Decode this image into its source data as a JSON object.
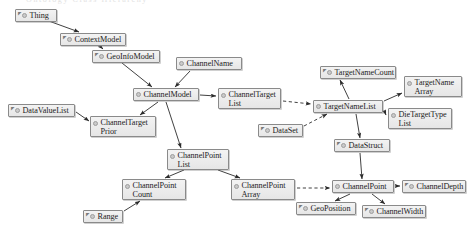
{
  "diagram": {
    "title_fragment": "Ontology Class Hierarchy",
    "canvas": {
      "width": 476,
      "height": 235
    },
    "colors": {
      "node_fill_top": "#f3f3f3",
      "node_fill_bottom": "#e6e6e6",
      "node_border": "#8a8a8a",
      "bullet_fill": "#c9c9c9",
      "edge": "#2b2b2b",
      "background": "#ffffff"
    },
    "nodes": [
      {
        "id": "thing",
        "label": "Thing",
        "x": 15,
        "y": 9,
        "w": 42,
        "h": 13,
        "sup": true,
        "lines": 1
      },
      {
        "id": "context-model",
        "label": "ContextModel",
        "x": 60,
        "y": 33,
        "w": 66,
        "h": 13,
        "sup": true,
        "lines": 1
      },
      {
        "id": "geo-info-model",
        "label": "GeoInfoModel",
        "x": 92,
        "y": 50,
        "w": 68,
        "h": 13,
        "sup": true,
        "lines": 1
      },
      {
        "id": "channel-name",
        "label": "ChannelName",
        "x": 176,
        "y": 57,
        "w": 66,
        "h": 13,
        "sup": false,
        "lines": 1
      },
      {
        "id": "channel-model",
        "label": "ChannelModel",
        "x": 133,
        "y": 88,
        "w": 66,
        "h": 13,
        "sup": false,
        "lines": 1
      },
      {
        "id": "data-value-list",
        "label": "DataValueList",
        "x": 8,
        "y": 104,
        "w": 67,
        "h": 13,
        "sup": true,
        "lines": 1
      },
      {
        "id": "channel-target-prior",
        "label": "ChannelTarget\nPrior",
        "x": 90,
        "y": 116,
        "w": 66,
        "h": 21,
        "sup": false,
        "lines": 2
      },
      {
        "id": "channel-target-list",
        "label": "ChannelTarget\nList",
        "x": 218,
        "y": 88,
        "w": 63,
        "h": 21,
        "sup": false,
        "lines": 2
      },
      {
        "id": "target-name-count",
        "label": "TargetNameCount",
        "x": 320,
        "y": 66,
        "w": 76,
        "h": 13,
        "sup": true,
        "lines": 1
      },
      {
        "id": "target-name-array",
        "label": "TargetName\nArray",
        "x": 404,
        "y": 76,
        "w": 58,
        "h": 21,
        "sup": false,
        "lines": 2
      },
      {
        "id": "target-name-list",
        "label": "TargetNameList",
        "x": 313,
        "y": 100,
        "w": 70,
        "h": 13,
        "sup": false,
        "lines": 1
      },
      {
        "id": "die-target-type-list",
        "label": "DieTargetType\nList",
        "x": 388,
        "y": 108,
        "w": 64,
        "h": 21,
        "sup": false,
        "lines": 2
      },
      {
        "id": "data-set",
        "label": "DataSet",
        "x": 258,
        "y": 124,
        "w": 45,
        "h": 13,
        "sup": true,
        "lines": 1
      },
      {
        "id": "data-struct",
        "label": "DataStruct",
        "x": 334,
        "y": 139,
        "w": 56,
        "h": 13,
        "sup": true,
        "lines": 1
      },
      {
        "id": "channel-point-list",
        "label": "ChannelPoint\nList",
        "x": 167,
        "y": 149,
        "w": 62,
        "h": 21,
        "sup": false,
        "lines": 2
      },
      {
        "id": "channel-point-count",
        "label": "ChannelPoint\nCount",
        "x": 122,
        "y": 179,
        "w": 64,
        "h": 21,
        "sup": false,
        "lines": 2
      },
      {
        "id": "channel-point-array",
        "label": "ChannelPoint\nArray",
        "x": 231,
        "y": 179,
        "w": 64,
        "h": 21,
        "sup": false,
        "lines": 2
      },
      {
        "id": "channel-point",
        "label": "ChannelPoint",
        "x": 332,
        "y": 180,
        "w": 62,
        "h": 13,
        "sup": false,
        "lines": 1
      },
      {
        "id": "channel-depth",
        "label": "ChannelDepth",
        "x": 402,
        "y": 180,
        "w": 64,
        "h": 13,
        "sup": true,
        "lines": 1
      },
      {
        "id": "range",
        "label": "Range",
        "x": 83,
        "y": 210,
        "w": 40,
        "h": 13,
        "sup": true,
        "lines": 1
      },
      {
        "id": "geo-position",
        "label": "GeoPosition",
        "x": 296,
        "y": 202,
        "w": 60,
        "h": 13,
        "sup": true,
        "lines": 1
      },
      {
        "id": "channel-width",
        "label": "ChannelWidth",
        "x": 362,
        "y": 205,
        "w": 64,
        "h": 13,
        "sup": true,
        "lines": 1
      }
    ],
    "edges": [
      {
        "from": "thing",
        "to": "context-model",
        "style": "solid",
        "x1": 46,
        "y1": 20,
        "x2": 79,
        "y2": 32
      },
      {
        "from": "context-model",
        "to": "geo-info-model",
        "style": "solid",
        "x1": 100,
        "y1": 46,
        "x2": 103,
        "y2": 49
      },
      {
        "from": "geo-info-model",
        "to": "channel-model",
        "style": "solid",
        "x1": 122,
        "y1": 63,
        "x2": 152,
        "y2": 87
      },
      {
        "from": "channel-name",
        "to": "channel-model",
        "style": "solid",
        "x1": 190,
        "y1": 71,
        "x2": 175,
        "y2": 87
      },
      {
        "from": "channel-model",
        "to": "channel-target-list",
        "style": "solid",
        "x1": 200,
        "y1": 95,
        "x2": 216,
        "y2": 96
      },
      {
        "from": "channel-model",
        "to": "channel-target-prior",
        "style": "solid",
        "x1": 158,
        "y1": 102,
        "x2": 140,
        "y2": 115
      },
      {
        "from": "channel-model",
        "to": "channel-point-list",
        "style": "solid",
        "x1": 166,
        "y1": 102,
        "x2": 181,
        "y2": 148
      },
      {
        "from": "data-value-list",
        "to": "channel-target-prior",
        "style": "solid",
        "x1": 76,
        "y1": 112,
        "x2": 89,
        "y2": 121
      },
      {
        "from": "channel-target-list",
        "to": "target-name-list",
        "style": "dashed",
        "x1": 283,
        "y1": 101,
        "x2": 311,
        "y2": 104
      },
      {
        "from": "data-set",
        "to": "target-name-list",
        "style": "dashed",
        "x1": 304,
        "y1": 126,
        "x2": 327,
        "y2": 114
      },
      {
        "from": "target-name-list",
        "to": "target-name-count",
        "style": "solid",
        "x1": 349,
        "y1": 99,
        "x2": 340,
        "y2": 80
      },
      {
        "from": "target-name-list",
        "to": "target-name-array",
        "style": "solid",
        "x1": 384,
        "y1": 101,
        "x2": 402,
        "y2": 93
      },
      {
        "from": "target-name-list",
        "to": "die-target-type-list",
        "style": "solid",
        "x1": 384,
        "y1": 110,
        "x2": 386,
        "y2": 115
      },
      {
        "from": "target-name-list",
        "to": "data-struct",
        "style": "solid",
        "x1": 356,
        "y1": 114,
        "x2": 360,
        "y2": 138
      },
      {
        "from": "data-struct",
        "to": "channel-point",
        "style": "solid",
        "x1": 360,
        "y1": 153,
        "x2": 362,
        "y2": 179
      },
      {
        "from": "channel-point-list",
        "to": "channel-point-count",
        "style": "solid",
        "x1": 184,
        "y1": 170,
        "x2": 165,
        "y2": 178
      },
      {
        "from": "channel-point-list",
        "to": "channel-point-array",
        "style": "solid",
        "x1": 218,
        "y1": 170,
        "x2": 240,
        "y2": 178
      },
      {
        "from": "channel-point-array",
        "to": "channel-point",
        "style": "dashed",
        "x1": 297,
        "y1": 188,
        "x2": 330,
        "y2": 188
      },
      {
        "from": "range",
        "to": "channel-point-count",
        "style": "solid",
        "x1": 124,
        "y1": 211,
        "x2": 140,
        "y2": 201
      },
      {
        "from": "channel-point",
        "to": "channel-depth",
        "style": "solid",
        "x1": 395,
        "y1": 186,
        "x2": 400,
        "y2": 186
      },
      {
        "from": "channel-point",
        "to": "geo-position",
        "style": "solid",
        "x1": 350,
        "y1": 194,
        "x2": 335,
        "y2": 201
      },
      {
        "from": "channel-point",
        "to": "channel-width",
        "style": "solid",
        "x1": 372,
        "y1": 194,
        "x2": 385,
        "y2": 204
      }
    ]
  }
}
